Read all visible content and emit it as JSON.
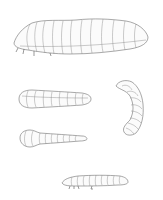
{
  "plate": {
    "background": "#ffffff",
    "line_color": "#6e6e6e",
    "figures": [
      {
        "name": "large-caterpillar-lateral",
        "segments": 13
      },
      {
        "name": "grub-dorsal-1",
        "segments": 10
      },
      {
        "name": "curved-grub",
        "segments": 9
      },
      {
        "name": "grub-dorsal-2",
        "segments": 11
      },
      {
        "name": "small-larva-lateral",
        "segments": 12
      }
    ]
  }
}
